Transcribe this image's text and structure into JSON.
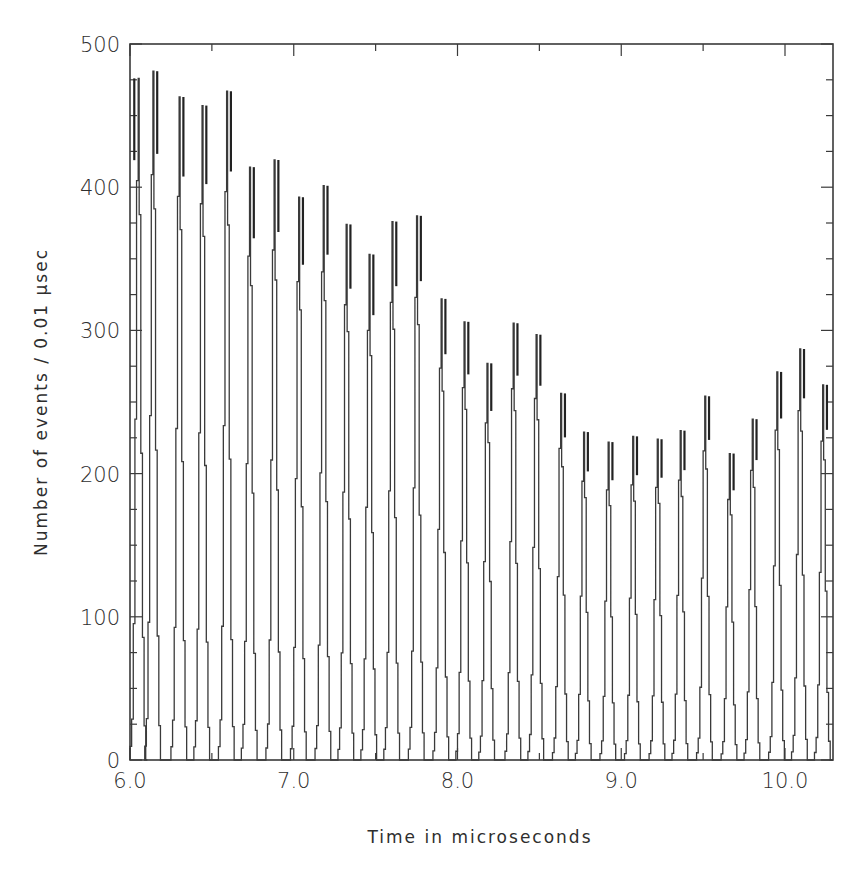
{
  "chart_data": {
    "type": "line",
    "style": "histogram-step",
    "title": "",
    "xlabel": "Time in microseconds",
    "ylabel": "Number of events / 0.01 μsec",
    "xlim": [
      6.0,
      10.3
    ],
    "ylim": [
      0,
      500
    ],
    "x_ticks": [
      "6.0",
      "7.0",
      "8.0",
      "9.0",
      "10.0"
    ],
    "y_ticks": [
      "0",
      "100",
      "200",
      "300",
      "400",
      "500"
    ],
    "grid": false,
    "legend": null,
    "bin_width_us": 0.01,
    "pulse_period_us": 0.148,
    "peaks": [
      {
        "t": 6.02,
        "count": 476
      },
      {
        "t": 6.16,
        "count": 481
      },
      {
        "t": 6.32,
        "count": 463
      },
      {
        "t": 6.46,
        "count": 457
      },
      {
        "t": 6.61,
        "count": 467
      },
      {
        "t": 6.75,
        "count": 414
      },
      {
        "t": 6.9,
        "count": 419
      },
      {
        "t": 7.05,
        "count": 393
      },
      {
        "t": 7.2,
        "count": 401
      },
      {
        "t": 7.34,
        "count": 374
      },
      {
        "t": 7.48,
        "count": 353
      },
      {
        "t": 7.62,
        "count": 376
      },
      {
        "t": 7.77,
        "count": 380
      },
      {
        "t": 7.92,
        "count": 322
      },
      {
        "t": 8.06,
        "count": 306
      },
      {
        "t": 8.2,
        "count": 277
      },
      {
        "t": 8.36,
        "count": 305
      },
      {
        "t": 8.5,
        "count": 297
      },
      {
        "t": 8.65,
        "count": 256
      },
      {
        "t": 8.79,
        "count": 229
      },
      {
        "t": 8.94,
        "count": 222
      },
      {
        "t": 9.09,
        "count": 226
      },
      {
        "t": 9.24,
        "count": 224
      },
      {
        "t": 9.38,
        "count": 230
      },
      {
        "t": 9.53,
        "count": 254
      },
      {
        "t": 9.68,
        "count": 214
      },
      {
        "t": 9.82,
        "count": 238
      },
      {
        "t": 9.97,
        "count": 271
      },
      {
        "t": 10.11,
        "count": 287
      },
      {
        "t": 10.25,
        "count": 262
      }
    ],
    "baseline": 0,
    "line_color": "#3a3a3a",
    "background": "#ffffff"
  },
  "labels": {
    "xlabel": "Time in microseconds",
    "ylabel": "Number of events / 0.01 μsec"
  }
}
